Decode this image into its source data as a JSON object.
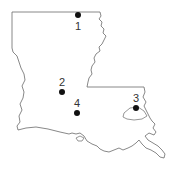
{
  "map": {
    "region": "Louisiana",
    "outline_color": "#6a6a6a",
    "dot_color": "#111111",
    "points": [
      {
        "id": "1",
        "label": "1",
        "x": 78,
        "y": 15,
        "label_x": 78,
        "label_y": 30
      },
      {
        "id": "2",
        "label": "2",
        "x": 62,
        "y": 92,
        "label_x": 62,
        "label_y": 86
      },
      {
        "id": "3",
        "label": "3",
        "x": 136,
        "y": 108,
        "label_x": 136,
        "label_y": 102
      },
      {
        "id": "4",
        "label": "4",
        "x": 77,
        "y": 113,
        "label_x": 77,
        "label_y": 107
      }
    ]
  }
}
